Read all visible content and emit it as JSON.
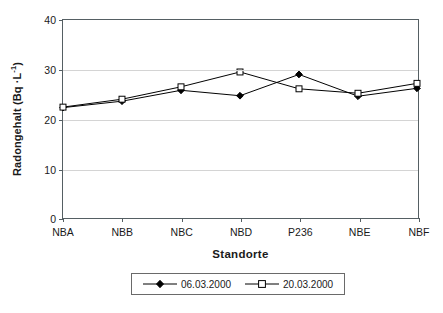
{
  "chart_data": {
    "type": "line",
    "title": "",
    "xlabel": "Standorte",
    "ylabel_plain": "Radongehalt (Bq ·L-1)",
    "ylabel_prefix": "Radongehalt (Bq ·L",
    "ylabel_exponent": "-1",
    "ylabel_suffix": ")",
    "categories": [
      "NBA",
      "NBB",
      "NBC",
      "NBD",
      "P236",
      "NBE",
      "NBF"
    ],
    "yticks": [
      0,
      10,
      20,
      30,
      40
    ],
    "ylim": [
      0,
      40
    ],
    "grid": "horizontal",
    "legend_position": "bottom",
    "series": [
      {
        "name": "06.03.2000",
        "marker": "filled-diamond",
        "color": "#000000",
        "values": [
          22.3,
          23.6,
          25.8,
          24.7,
          29.0,
          24.6,
          26.2
        ]
      },
      {
        "name": "20.03.2000",
        "marker": "open-square",
        "color": "#000000",
        "values": [
          22.4,
          24.0,
          26.5,
          29.5,
          26.1,
          25.2,
          27.2
        ]
      }
    ]
  },
  "legend": {
    "entries": [
      {
        "label": "06.03.2000"
      },
      {
        "label": "20.03.2000"
      }
    ]
  },
  "axes": {
    "x_title": "Standorte"
  }
}
